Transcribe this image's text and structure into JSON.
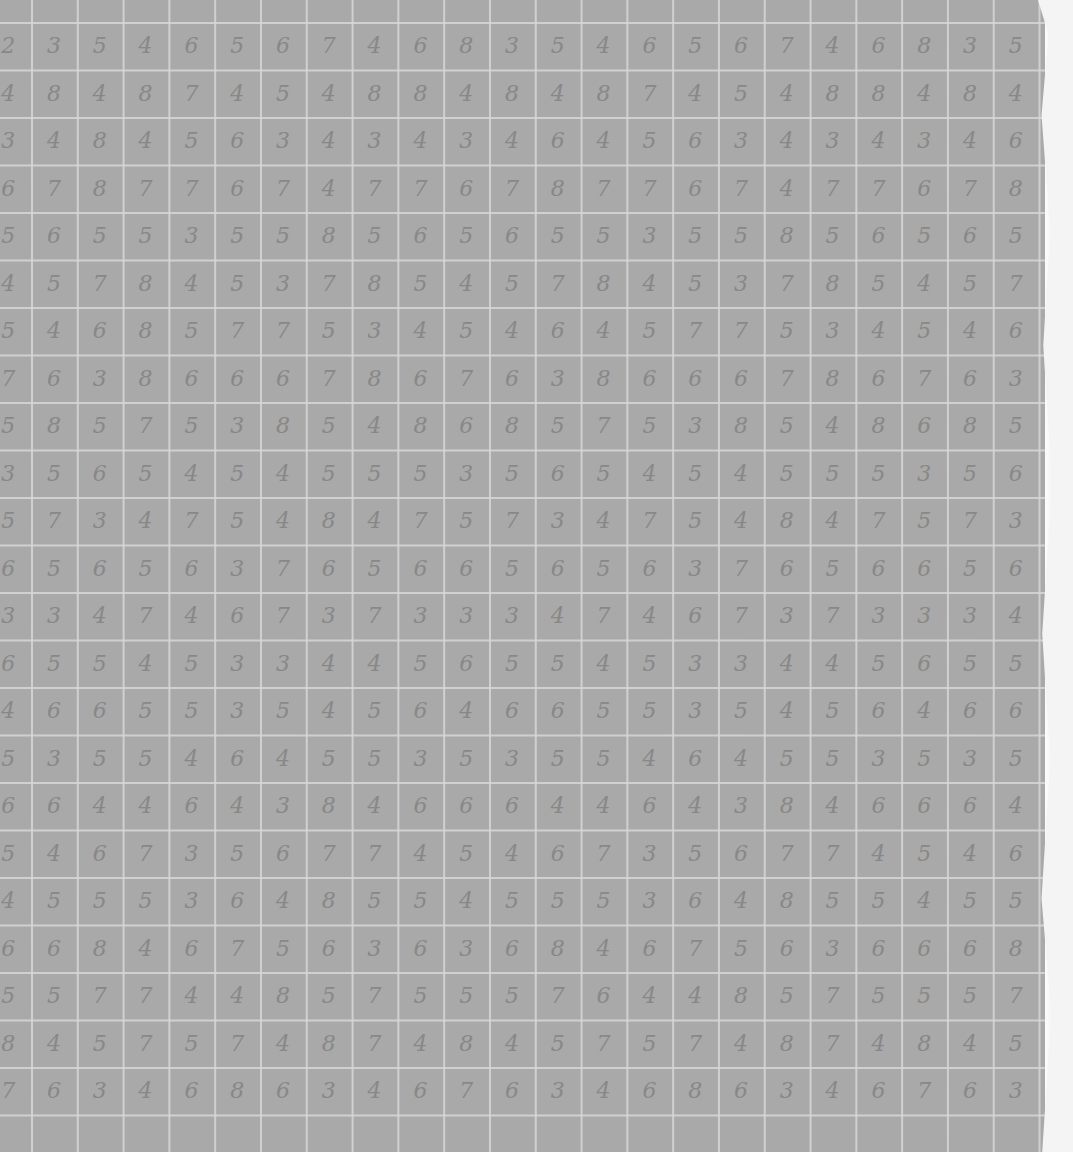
{
  "grid": {
    "col_start": 31,
    "col_pitch": 45.8,
    "row_start": 22,
    "row_pitch": 47.5,
    "paper_color": "#a9a9a9",
    "ink_color": "#888888"
  },
  "rows": [
    [
      "2",
      "3",
      "5",
      "4",
      "6",
      "5",
      "6",
      "7",
      "4",
      "6",
      "8",
      "3",
      "5",
      "4",
      "6",
      "5",
      "6",
      "7",
      "4",
      "6",
      "8",
      "3",
      "5"
    ],
    [
      "4",
      "8",
      "4",
      "8",
      "7",
      "4",
      "5",
      "4",
      "8",
      "8",
      "4",
      "8",
      "4",
      "8",
      "7",
      "4",
      "5",
      "4",
      "8",
      "8",
      "4",
      "8",
      "4"
    ],
    [
      "3",
      "4",
      "8",
      "4",
      "5",
      "6",
      "3",
      "4",
      "3",
      "4",
      "3",
      "4",
      "6",
      "4",
      "5",
      "6",
      "3",
      "4",
      "3",
      "4",
      "3",
      "4",
      "6"
    ],
    [
      "6",
      "7",
      "8",
      "7",
      "7",
      "6",
      "7",
      "4",
      "7",
      "7",
      "6",
      "7",
      "8",
      "7",
      "7",
      "6",
      "7",
      "4",
      "7",
      "7",
      "6",
      "7",
      "8"
    ],
    [
      "5",
      "6",
      "5",
      "5",
      "3",
      "5",
      "5",
      "8",
      "5",
      "6",
      "5",
      "6",
      "5",
      "5",
      "3",
      "5",
      "5",
      "8",
      "5",
      "6",
      "5",
      "6",
      "5"
    ],
    [
      "4",
      "5",
      "7",
      "8",
      "4",
      "5",
      "3",
      "7",
      "8",
      "5",
      "4",
      "5",
      "7",
      "8",
      "4",
      "5",
      "3",
      "7",
      "8",
      "5",
      "4",
      "5",
      "7"
    ],
    [
      "5",
      "4",
      "6",
      "8",
      "5",
      "7",
      "7",
      "5",
      "3",
      "4",
      "5",
      "4",
      "6",
      "4",
      "5",
      "7",
      "7",
      "5",
      "3",
      "4",
      "5",
      "4",
      "6"
    ],
    [
      "7",
      "6",
      "3",
      "8",
      "6",
      "6",
      "6",
      "7",
      "8",
      "6",
      "7",
      "6",
      "3",
      "8",
      "6",
      "6",
      "6",
      "7",
      "8",
      "6",
      "7",
      "6",
      "3"
    ],
    [
      "5",
      "8",
      "5",
      "7",
      "5",
      "3",
      "8",
      "5",
      "4",
      "8",
      "6",
      "8",
      "5",
      "7",
      "5",
      "3",
      "8",
      "5",
      "4",
      "8",
      "6",
      "8",
      "5"
    ],
    [
      "3",
      "5",
      "6",
      "5",
      "4",
      "5",
      "4",
      "5",
      "5",
      "5",
      "3",
      "5",
      "6",
      "5",
      "4",
      "5",
      "4",
      "5",
      "5",
      "5",
      "3",
      "5",
      "6"
    ],
    [
      "5",
      "7",
      "3",
      "4",
      "7",
      "5",
      "4",
      "8",
      "4",
      "7",
      "5",
      "7",
      "3",
      "4",
      "7",
      "5",
      "4",
      "8",
      "4",
      "7",
      "5",
      "7",
      "3"
    ],
    [
      "6",
      "5",
      "6",
      "5",
      "6",
      "3",
      "7",
      "6",
      "5",
      "6",
      "6",
      "5",
      "6",
      "5",
      "6",
      "3",
      "7",
      "6",
      "5",
      "6",
      "6",
      "5",
      "6"
    ],
    [
      "3",
      "3",
      "4",
      "7",
      "4",
      "6",
      "7",
      "3",
      "7",
      "3",
      "3",
      "3",
      "4",
      "7",
      "4",
      "6",
      "7",
      "3",
      "7",
      "3",
      "3",
      "3",
      "4"
    ],
    [
      "6",
      "5",
      "5",
      "4",
      "5",
      "3",
      "3",
      "4",
      "4",
      "5",
      "6",
      "5",
      "5",
      "4",
      "5",
      "3",
      "3",
      "4",
      "4",
      "5",
      "6",
      "5",
      "5"
    ],
    [
      "4",
      "6",
      "6",
      "5",
      "5",
      "3",
      "5",
      "4",
      "5",
      "6",
      "4",
      "6",
      "6",
      "5",
      "5",
      "3",
      "5",
      "4",
      "5",
      "6",
      "4",
      "6",
      "6"
    ],
    [
      "5",
      "3",
      "5",
      "5",
      "4",
      "6",
      "4",
      "5",
      "5",
      "3",
      "5",
      "3",
      "5",
      "5",
      "4",
      "6",
      "4",
      "5",
      "5",
      "3",
      "5",
      "3",
      "5"
    ],
    [
      "6",
      "6",
      "4",
      "4",
      "6",
      "4",
      "3",
      "8",
      "4",
      "6",
      "6",
      "6",
      "4",
      "4",
      "6",
      "4",
      "3",
      "8",
      "4",
      "6",
      "6",
      "6",
      "4"
    ],
    [
      "5",
      "4",
      "6",
      "7",
      "3",
      "5",
      "6",
      "7",
      "7",
      "4",
      "5",
      "4",
      "6",
      "7",
      "3",
      "5",
      "6",
      "7",
      "7",
      "4",
      "5",
      "4",
      "6"
    ],
    [
      "4",
      "5",
      "5",
      "5",
      "3",
      "6",
      "4",
      "8",
      "5",
      "5",
      "4",
      "5",
      "5",
      "5",
      "3",
      "6",
      "4",
      "8",
      "5",
      "5",
      "4",
      "5",
      "5"
    ],
    [
      "6",
      "6",
      "8",
      "4",
      "6",
      "7",
      "5",
      "6",
      "3",
      "6",
      "3",
      "6",
      "8",
      "4",
      "6",
      "7",
      "5",
      "6",
      "3",
      "6",
      "6",
      "6",
      "8"
    ],
    [
      "5",
      "5",
      "7",
      "7",
      "4",
      "4",
      "8",
      "5",
      "7",
      "5",
      "5",
      "5",
      "7",
      "6",
      "4",
      "4",
      "8",
      "5",
      "7",
      "5",
      "5",
      "5",
      "7"
    ],
    [
      "8",
      "4",
      "5",
      "7",
      "5",
      "7",
      "4",
      "8",
      "7",
      "4",
      "8",
      "4",
      "5",
      "7",
      "5",
      "7",
      "4",
      "8",
      "7",
      "4",
      "8",
      "4",
      "5"
    ],
    [
      "7",
      "6",
      "3",
      "4",
      "6",
      "8",
      "6",
      "3",
      "4",
      "6",
      "7",
      "6",
      "3",
      "4",
      "6",
      "8",
      "6",
      "3",
      "4",
      "6",
      "7",
      "6",
      "3"
    ]
  ]
}
